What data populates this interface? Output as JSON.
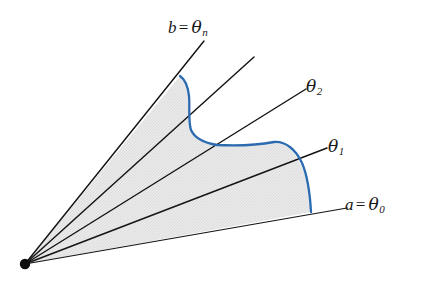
{
  "figure": {
    "kind": "polar-sector-partition-diagram",
    "background_color": "#ffffff",
    "width": 429,
    "height": 282
  },
  "chart_data": {
    "type": "diagram",
    "title": "",
    "xlabel": "",
    "ylabel": "",
    "vertex": {
      "x": 25,
      "y": 264,
      "label": "",
      "radius": 5.2
    },
    "rays": [
      {
        "name": "theta_0",
        "label": "a = θ0",
        "angle_deg": 9.5,
        "tip_x": 347,
        "tip_y": 208,
        "labeled": true
      },
      {
        "name": "theta_1",
        "label": "θ1",
        "angle_deg": 21.0,
        "tip_x": 327,
        "tip_y": 148,
        "labeled": true
      },
      {
        "name": "theta_2",
        "label": "θ2",
        "angle_deg": 32.0,
        "tip_x": 306,
        "tip_y": 89,
        "labeled": true
      },
      {
        "name": "theta_mid",
        "label": "",
        "angle_deg": 41.0,
        "tip_x": 254,
        "tip_y": 57,
        "labeled": false
      },
      {
        "name": "theta_n",
        "label": "b = θn",
        "angle_deg": 50.0,
        "tip_x": 204,
        "tip_y": 41,
        "labeled": true
      }
    ],
    "boundary_curve": {
      "name": "r = f(theta)",
      "color": "#2C6BB0",
      "stroke_width": 2.3,
      "points": [
        [
          180,
          76
        ],
        [
          185,
          83
        ],
        [
          188,
          93
        ],
        [
          189,
          104
        ],
        [
          189,
          116
        ],
        [
          191,
          128
        ],
        [
          196,
          138
        ],
        [
          205,
          143
        ],
        [
          220,
          145
        ],
        [
          240,
          145
        ],
        [
          258,
          144
        ],
        [
          274,
          142
        ],
        [
          288,
          146
        ],
        [
          299,
          158
        ],
        [
          306,
          174
        ],
        [
          309,
          191
        ],
        [
          310,
          205
        ],
        [
          311,
          212
        ]
      ]
    },
    "shaded_region": {
      "fill_color": "#E7E7E7",
      "texture": "fine-stipple",
      "opacity": 1
    },
    "line_color": "#141414",
    "legend": [],
    "grid": false
  },
  "labels": {
    "theta_n": {
      "var": "b",
      "eq": "=",
      "sym": "θ",
      "sub": "n"
    },
    "theta_2": {
      "sym": "θ",
      "sub": "2"
    },
    "theta_1": {
      "sym": "θ",
      "sub": "1"
    },
    "theta_0": {
      "var": "a",
      "eq": "=",
      "sym": "θ",
      "sub": "0"
    }
  }
}
